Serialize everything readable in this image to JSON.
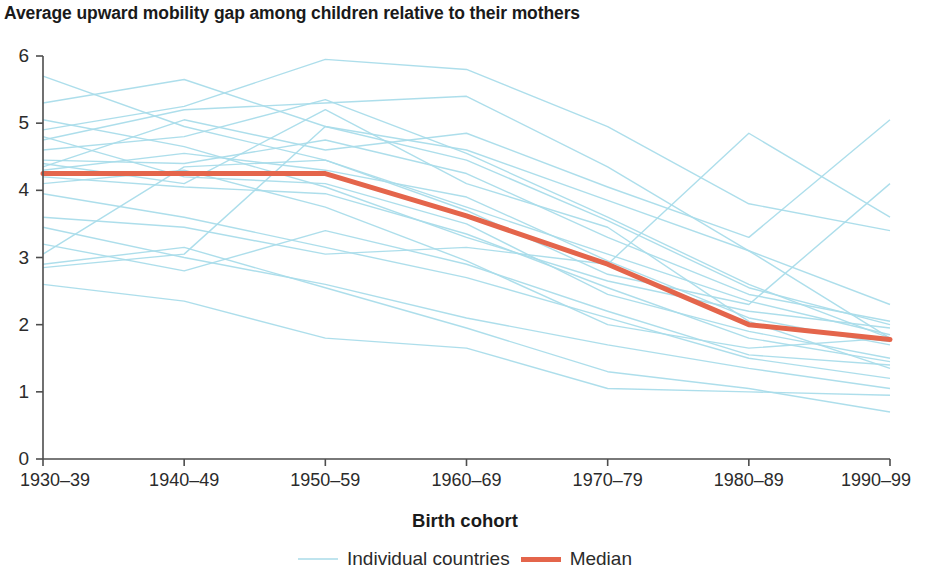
{
  "header": {
    "title": "Average upward mobility gap among children relative to their mothers"
  },
  "axes": {
    "xlabel": "Birth cohort",
    "ylabel": "",
    "xtick_labels": [
      "1930–39",
      "1940–49",
      "1950–59",
      "1960–69",
      "1970–79",
      "1980–89",
      "1990–99"
    ],
    "ytick_labels": [
      "0",
      "1",
      "2",
      "3",
      "4",
      "5",
      "6"
    ]
  },
  "legend": {
    "position": "bottom-center",
    "entries": [
      {
        "label": "Individual countries",
        "color": "#a9dcea",
        "icon": "line-swatch-icon"
      },
      {
        "label": "Median",
        "color": "#e4654b",
        "icon": "line-swatch-icon"
      }
    ]
  },
  "colors": {
    "country_line": "#a9dcea",
    "median_line": "#e4654b",
    "axis": "#4d4d4d",
    "text": "#1a1a1a",
    "background": "#ffffff"
  },
  "chart_data": {
    "type": "line",
    "title": "Average upward mobility gap among children relative to their mothers",
    "subtitle": "",
    "xlabel": "Birth cohort",
    "ylabel": "",
    "categories": [
      "1930–39",
      "1940–49",
      "1950–59",
      "1960–69",
      "1970–79",
      "1980–89",
      "1990–99"
    ],
    "ylim": [
      0,
      6
    ],
    "ytick_step": 1,
    "grid": false,
    "legend_position": "bottom-center",
    "series": [
      {
        "name": "Median",
        "role": "median",
        "color": "#e4654b",
        "width": 5,
        "values": [
          4.25,
          4.25,
          4.25,
          3.62,
          2.9,
          2.0,
          1.78
        ]
      },
      {
        "name": "Country 1",
        "role": "individual",
        "color": "#a9dcea",
        "values": [
          5.7,
          4.95,
          4.45,
          3.75,
          3.05,
          2.35,
          1.85
        ]
      },
      {
        "name": "Country 2",
        "role": "individual",
        "color": "#a9dcea",
        "values": [
          5.3,
          5.65,
          4.95,
          4.6,
          3.85,
          3.1,
          2.3
        ]
      },
      {
        "name": "Country 3",
        "role": "individual",
        "color": "#a9dcea",
        "values": [
          4.9,
          5.25,
          5.95,
          5.8,
          4.95,
          3.8,
          3.4
        ]
      },
      {
        "name": "Country 4",
        "role": "individual",
        "color": "#a9dcea",
        "values": [
          4.75,
          5.2,
          5.3,
          5.4,
          4.35,
          3.1,
          1.8
        ]
      },
      {
        "name": "Country 5",
        "role": "individual",
        "color": "#a9dcea",
        "values": [
          4.6,
          4.8,
          5.35,
          4.55,
          3.6,
          2.6,
          1.8
        ]
      },
      {
        "name": "Country 6",
        "role": "individual",
        "color": "#a9dcea",
        "values": [
          4.45,
          4.4,
          4.75,
          4.25,
          3.3,
          2.45,
          2.05
        ]
      },
      {
        "name": "Country 7",
        "role": "individual",
        "color": "#a9dcea",
        "values": [
          4.3,
          4.55,
          4.3,
          3.9,
          2.95,
          2.1,
          1.7
        ]
      },
      {
        "name": "Country 8",
        "role": "individual",
        "color": "#a9dcea",
        "values": [
          4.25,
          4.25,
          4.25,
          3.6,
          2.9,
          2.0,
          1.75
        ]
      },
      {
        "name": "Country 9",
        "role": "individual",
        "color": "#a9dcea",
        "values": [
          4.2,
          4.05,
          3.95,
          3.35,
          2.55,
          1.8,
          1.45
        ]
      },
      {
        "name": "Country 10",
        "role": "individual",
        "color": "#a9dcea",
        "values": [
          4.1,
          4.3,
          3.75,
          2.95,
          2.0,
          1.65,
          1.8
        ]
      },
      {
        "name": "Country 11",
        "role": "individual",
        "color": "#a9dcea",
        "values": [
          3.95,
          3.6,
          3.15,
          2.7,
          2.1,
          1.5,
          1.2
        ]
      },
      {
        "name": "Country 12",
        "role": "individual",
        "color": "#a9dcea",
        "values": [
          3.6,
          3.45,
          3.05,
          3.15,
          2.9,
          4.85,
          3.6
        ]
      },
      {
        "name": "Country 13",
        "role": "individual",
        "color": "#a9dcea",
        "values": [
          3.45,
          3.0,
          2.6,
          2.1,
          1.7,
          1.35,
          1.05
        ]
      },
      {
        "name": "Country 14",
        "role": "individual",
        "color": "#a9dcea",
        "values": [
          3.2,
          2.8,
          3.4,
          2.9,
          2.2,
          1.55,
          1.4
        ]
      },
      {
        "name": "Country 15",
        "role": "individual",
        "color": "#a9dcea",
        "values": [
          2.9,
          3.15,
          2.55,
          1.95,
          1.3,
          1.05,
          0.7
        ]
      },
      {
        "name": "Country 16",
        "role": "individual",
        "color": "#a9dcea",
        "values": [
          2.85,
          3.05,
          4.95,
          4.45,
          3.55,
          2.55,
          2.0
        ]
      },
      {
        "name": "Country 17",
        "role": "individual",
        "color": "#a9dcea",
        "values": [
          2.6,
          2.35,
          1.8,
          1.65,
          1.05,
          1.0,
          0.95
        ]
      },
      {
        "name": "Country 18",
        "role": "individual",
        "color": "#a9dcea",
        "values": [
          4.35,
          5.05,
          4.6,
          4.85,
          4.05,
          3.3,
          5.05
        ]
      },
      {
        "name": "Country 19",
        "role": "individual",
        "color": "#a9dcea",
        "values": [
          4.8,
          4.2,
          4.1,
          3.5,
          2.45,
          1.9,
          1.5
        ]
      },
      {
        "name": "Country 20",
        "role": "individual",
        "color": "#a9dcea",
        "values": [
          5.05,
          4.65,
          4.05,
          3.3,
          2.65,
          2.2,
          1.95
        ]
      },
      {
        "name": "Country 21",
        "role": "individual",
        "color": "#a9dcea",
        "values": [
          4.4,
          4.1,
          5.2,
          4.1,
          3.45,
          2.05,
          1.35
        ]
      },
      {
        "name": "Country 22",
        "role": "individual",
        "color": "#a9dcea",
        "values": [
          3.05,
          4.35,
          4.45,
          3.7,
          2.75,
          2.3,
          4.1
        ]
      }
    ]
  }
}
